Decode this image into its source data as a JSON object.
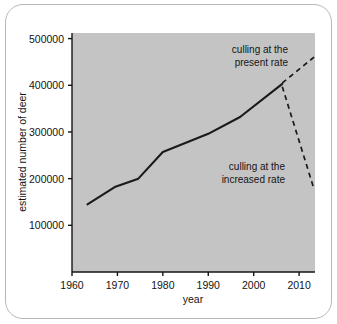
{
  "chart_data": {
    "type": "line",
    "title": "",
    "xlabel": "year",
    "ylabel": "estimated number of deer",
    "xlim": [
      1960,
      2013.5
    ],
    "ylim": [
      0,
      512000
    ],
    "grid": false,
    "legend": "none",
    "plot_background": "#c4c4c4",
    "line_color": "#1a1a1a",
    "x_ticks": [
      1960,
      1970,
      1980,
      1990,
      2000,
      2010
    ],
    "x_tick_labels": [
      "1960",
      "1970",
      "1980",
      "1990",
      "2000",
      "2010"
    ],
    "y_ticks": [
      100000,
      200000,
      300000,
      400000,
      500000
    ],
    "y_tick_labels": [
      "100000",
      "200000",
      "300000",
      "400000",
      "500000"
    ],
    "series": [
      {
        "name": "observed",
        "style": "solid",
        "x": [
          1963.4,
          1969.4,
          1974.6,
          1980.0,
          1990.0,
          1997.0,
          2006.3
        ],
        "values": [
          145000,
          182000,
          200000,
          257000,
          296000,
          332000,
          403000
        ]
      },
      {
        "name": "culling at the present rate",
        "style": "dashed",
        "x": [
          2006.3,
          2013.5
        ],
        "values": [
          405000,
          462000
        ]
      },
      {
        "name": "culling at the increased rate",
        "style": "dashed",
        "x": [
          2006.3,
          2013.3
        ],
        "values": [
          397000,
          177000
        ]
      }
    ],
    "annotations": [
      {
        "id": "present-rate",
        "line1": "culling at the",
        "line2": "present rate",
        "x": 2008.5,
        "y": 470000
      },
      {
        "id": "increased-rate",
        "line1": "culling at the",
        "line2": "increased rate",
        "x": 2003.0,
        "y": 243000
      }
    ]
  }
}
